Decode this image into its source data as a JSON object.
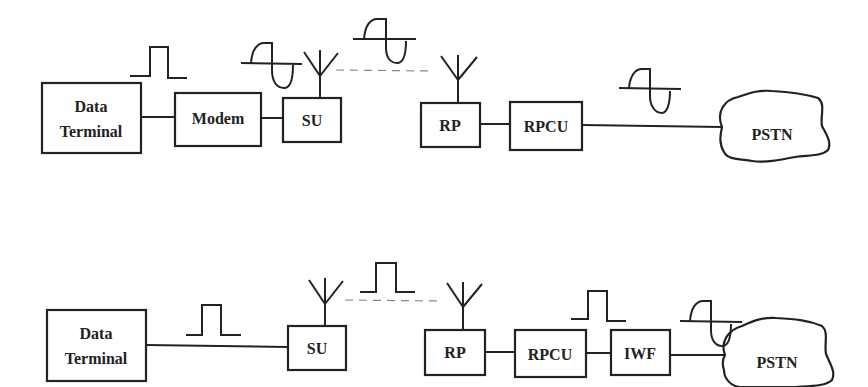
{
  "diagram": {
    "top": {
      "nodes": {
        "data_terminal": {
          "line1": "Data",
          "line2": "Terminal"
        },
        "modem": {
          "label": "Modem"
        },
        "su": {
          "label": "SU"
        },
        "rp": {
          "label": "RP"
        },
        "rpcu": {
          "label": "RPCU"
        },
        "pstn": {
          "label": "PSTN"
        }
      },
      "signals": [
        "pulse",
        "sine",
        "sine",
        "sine"
      ]
    },
    "bottom": {
      "nodes": {
        "data_terminal": {
          "line1": "Data",
          "line2": "Terminal"
        },
        "su": {
          "label": "SU"
        },
        "rp": {
          "label": "RP"
        },
        "rpcu": {
          "label": "RPCU"
        },
        "iwf": {
          "label": "IWF"
        },
        "pstn": {
          "label": "PSTN"
        }
      },
      "signals": [
        "pulse",
        "pulse",
        "pulse",
        "sine"
      ]
    },
    "colors": {
      "stroke": "#222222",
      "dash": "#888888",
      "background": "#ffffff"
    }
  }
}
